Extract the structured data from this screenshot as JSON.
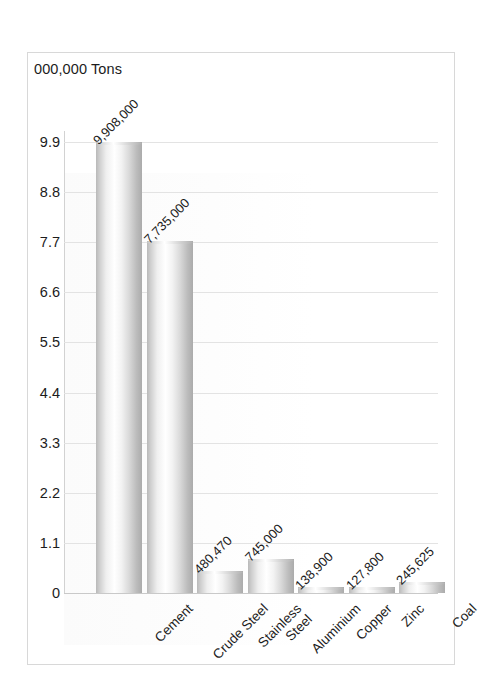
{
  "chart_data": {
    "type": "bar",
    "title": "000,000 Tons",
    "xlabel": "",
    "ylabel": "",
    "ylim": [
      0,
      9.9
    ],
    "grid": true,
    "legend": false,
    "y_unit_note": "axis values in millions of tons",
    "yticks": [
      "0",
      "1.1",
      "2.2",
      "3.3",
      "4.4",
      "5.5",
      "6.6",
      "7.7",
      "8.8",
      "9.9"
    ],
    "ytick_values": [
      0,
      1.1,
      2.2,
      3.3,
      4.4,
      5.5,
      6.6,
      7.7,
      8.8,
      9.9
    ],
    "categories": [
      "Cement",
      "Crude Steel",
      "Stainless\nSteel",
      "Aluminium",
      "Copper",
      "Zinc",
      "Coal"
    ],
    "values": [
      9908000,
      7735000,
      480470,
      745000,
      138900,
      127800,
      245625
    ],
    "plot_values": [
      9.908,
      7.735,
      0.48047,
      0.745,
      0.1389,
      0.1278,
      0.245625
    ],
    "data_labels": [
      "9,908,000",
      "7,735,000",
      "480,470",
      "745,000",
      "138,900",
      "127,800",
      "245,625"
    ],
    "bar_color": "#d5d5d5",
    "bar_style": "cylinder-gradient-gray",
    "background": "#ffffff",
    "grid_color": "#e3e3e3"
  },
  "categories_display": [
    {
      "line1": "Cement",
      "line2": ""
    },
    {
      "line1": "Crude Steel",
      "line2": ""
    },
    {
      "line1": "Stainless",
      "line2": "Steel"
    },
    {
      "line1": "Aluminium",
      "line2": ""
    },
    {
      "line1": "Copper",
      "line2": ""
    },
    {
      "line1": "Zinc",
      "line2": ""
    },
    {
      "line1": "Coal",
      "line2": ""
    }
  ]
}
